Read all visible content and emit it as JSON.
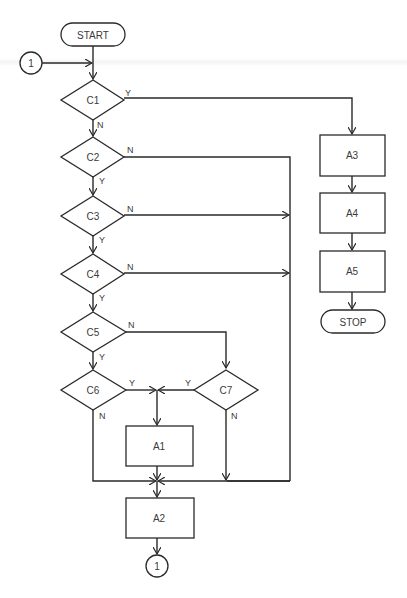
{
  "diagram": {
    "type": "flowchart",
    "terminals": {
      "start": "START",
      "stop": "STOP"
    },
    "connectors": {
      "entry": "1",
      "exit": "1"
    },
    "decisions": {
      "c1": "C1",
      "c2": "C2",
      "c3": "C3",
      "c4": "C4",
      "c5": "C5",
      "c6": "C6",
      "c7": "C7"
    },
    "processes": {
      "a1": "A1",
      "a2": "A2",
      "a3": "A3",
      "a4": "A4",
      "a5": "A5"
    },
    "edge_labels": {
      "c1_yes": "Y",
      "c1_no": "N",
      "c2_no": "N",
      "c2_yes": "Y",
      "c3_no": "N",
      "c3_yes": "Y",
      "c4_no": "N",
      "c4_yes": "Y",
      "c5_no": "N",
      "c5_yes": "Y",
      "c6_yes": "Y",
      "c6_no": "N",
      "c7_yes": "Y",
      "c7_no": "N"
    },
    "edges": [
      [
        "START",
        "C1"
      ],
      [
        "1",
        "C1"
      ],
      [
        "C1",
        "A3",
        "Y"
      ],
      [
        "C1",
        "C2",
        "N"
      ],
      [
        "C2",
        "C3",
        "Y"
      ],
      [
        "C2",
        "A2",
        "N"
      ],
      [
        "C3",
        "C4",
        "Y"
      ],
      [
        "C3",
        "A2",
        "N"
      ],
      [
        "C4",
        "C5",
        "Y"
      ],
      [
        "C4",
        "A2",
        "N"
      ],
      [
        "C5",
        "C6",
        "Y"
      ],
      [
        "C5",
        "C7",
        "N"
      ],
      [
        "C6",
        "A1",
        "Y"
      ],
      [
        "C6",
        "A2",
        "N"
      ],
      [
        "C7",
        "A1",
        "Y"
      ],
      [
        "C7",
        "A2",
        "N"
      ],
      [
        "A1",
        "A2"
      ],
      [
        "A2",
        "1"
      ],
      [
        "A3",
        "A4"
      ],
      [
        "A4",
        "A5"
      ],
      [
        "A5",
        "STOP"
      ]
    ]
  }
}
